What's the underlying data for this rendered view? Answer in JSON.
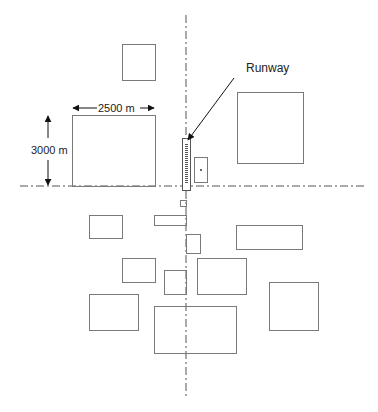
{
  "diagram": {
    "type": "site-plan",
    "colors": {
      "line": "#7a7a7a",
      "axis": "#555555",
      "arrow": "#111111",
      "text": "#222222"
    },
    "axes": {
      "vertical": {
        "x": 186,
        "y1": 15,
        "y2": 396
      },
      "horizontal": {
        "y": 186,
        "x1": 20,
        "x2": 366
      }
    },
    "runway": {
      "label": "Runway",
      "label_pos": {
        "x": 247,
        "y": 68
      },
      "rect": {
        "x": 182,
        "y": 138,
        "w": 8,
        "h": 52
      },
      "pointer": {
        "x1": 234,
        "y1": 78,
        "x2": 188,
        "y2": 140
      }
    },
    "dimensions": {
      "width_label": "2500 m",
      "height_label": "3000 m"
    },
    "blocks": [
      {
        "name": "block-top-square",
        "x": 122,
        "y": 44,
        "w": 33,
        "h": 36
      },
      {
        "name": "block-dimensioned-large",
        "x": 72,
        "y": 115,
        "w": 83,
        "h": 71
      },
      {
        "name": "block-terminal-small",
        "x": 194,
        "y": 157,
        "w": 13,
        "h": 25,
        "dot": true
      },
      {
        "name": "block-large-east",
        "x": 237,
        "y": 92,
        "w": 66,
        "h": 71
      },
      {
        "name": "block-tiny-south",
        "x": 180,
        "y": 200,
        "w": 6,
        "h": 6
      },
      {
        "name": "block-sw-1",
        "x": 89,
        "y": 215,
        "w": 33,
        "h": 23
      },
      {
        "name": "block-strip",
        "x": 154,
        "y": 215,
        "w": 32,
        "h": 10
      },
      {
        "name": "block-small-se",
        "x": 186,
        "y": 234,
        "w": 14,
        "h": 19
      },
      {
        "name": "block-east-wide",
        "x": 236,
        "y": 225,
        "w": 66,
        "h": 24
      },
      {
        "name": "block-sw-2",
        "x": 122,
        "y": 258,
        "w": 33,
        "h": 24
      },
      {
        "name": "block-center-small",
        "x": 164,
        "y": 270,
        "w": 22,
        "h": 24
      },
      {
        "name": "block-center-east",
        "x": 197,
        "y": 258,
        "w": 49,
        "h": 36
      },
      {
        "name": "block-sw-3",
        "x": 89,
        "y": 294,
        "w": 49,
        "h": 36
      },
      {
        "name": "block-far-east",
        "x": 269,
        "y": 282,
        "w": 49,
        "h": 48
      },
      {
        "name": "block-south-large",
        "x": 154,
        "y": 306,
        "w": 82,
        "h": 47
      }
    ]
  }
}
